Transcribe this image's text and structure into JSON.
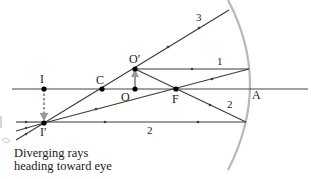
{
  "diagram": {
    "colors": {
      "ray": "#3a3a3a",
      "axis": "#444444",
      "mirror": "#b8b8b8",
      "dashed_image_arrow": "#9a9a9a",
      "object_arrow": "#9a9a9a",
      "point": "#000000"
    },
    "points": {
      "I": {
        "label": "I",
        "x": 44,
        "y": 89
      },
      "C": {
        "label": "C",
        "x": 102,
        "y": 89
      },
      "O": {
        "label": "O",
        "x": 135,
        "y": 89
      },
      "O_prime": {
        "label": "O′",
        "x": 135,
        "y": 69
      },
      "F": {
        "label": "F",
        "x": 176,
        "y": 89
      },
      "A": {
        "label": "A",
        "x": 249,
        "y": 89
      },
      "I_prime": {
        "label": "I′",
        "x": 44,
        "y": 123
      }
    },
    "rays": [
      {
        "id": "1",
        "label": "1",
        "description": "Parallel to axis, reflects through F"
      },
      {
        "id": "2",
        "label": "2",
        "description": "Through F, reflects parallel to axis"
      },
      {
        "id": "3",
        "label": "3",
        "description": "Through C, reflects back on itself"
      }
    ],
    "caption": {
      "line1": "Diverging rays",
      "line2": "heading toward eye"
    }
  }
}
